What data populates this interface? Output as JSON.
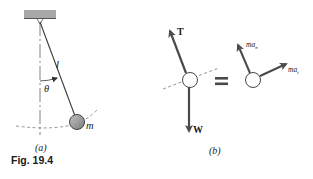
{
  "figure": {
    "caption": "Fig. 19.4",
    "panel_a": {
      "sublabel": "(a)",
      "length_label": "l",
      "angle_label": "θ",
      "mass_label": "m"
    },
    "panel_b": {
      "sublabel": "(b)",
      "tension_label": "T",
      "weight_label": "W",
      "equals_sign": "=",
      "normal_accel_label_base": "ma",
      "normal_accel_label_sub": "n",
      "tangential_accel_label_base": "ma",
      "tangential_accel_label_sub": "t"
    },
    "colors": {
      "line": "#3a3a3a",
      "arrow": "#4a4a4a",
      "ceiling": "#9a9a9a",
      "bob_fill": "#8c8c8c",
      "dashed": "#555555"
    }
  }
}
